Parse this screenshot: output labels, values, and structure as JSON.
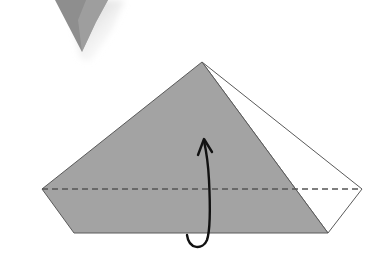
{
  "diagram": {
    "type": "origami-fold-step",
    "colors": {
      "paper_colored": "#a3a3a3",
      "paper_white": "#ffffff",
      "outline": "#5a5a5a",
      "fold_line": "#555555",
      "arrow": "#111111",
      "previous_step_shape": "#8e8e8e",
      "background": "#ffffff"
    },
    "shapes": {
      "previous_step_fragment": {
        "tip": [
          82,
          52
        ]
      },
      "colored_face": {
        "points": "202,62 42,189 74,233 328,233"
      },
      "white_flap": {
        "points": "202,62 362,189 328,233"
      },
      "fold_line": {
        "x1": 42,
        "y1": 189,
        "x2": 362,
        "y2": 189,
        "style": "dashed"
      },
      "arrow": {
        "from": [
          187,
          233
        ],
        "to": [
          204,
          140
        ],
        "kind": "fold-behind"
      }
    }
  }
}
